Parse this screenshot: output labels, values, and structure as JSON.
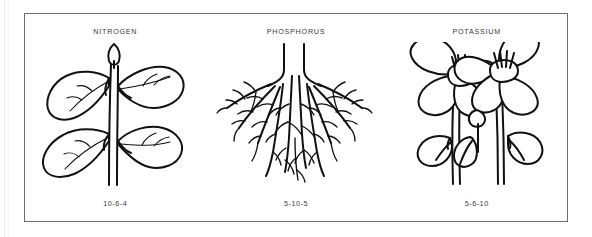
{
  "figure": {
    "frame": {
      "border_color": "#6e6e6e",
      "background": "#ffffff"
    },
    "panels": [
      {
        "id": "nitrogen",
        "title": "NITROGEN",
        "ratio": "10-6-4",
        "illustration": "leafy-plant-with-bud",
        "illustration_label": "Leafy plant with central stem, four broad leaves and an apical bud"
      },
      {
        "id": "phosphorus",
        "title": "PHOSPHORUS",
        "ratio": "5-10-5",
        "illustration": "branching-root-system",
        "illustration_label": "Branching fibrous root system descending from a cut stem"
      },
      {
        "id": "potassium",
        "title": "POTASSIUM",
        "ratio": "5-6-10",
        "illustration": "two-flowers-with-leaves",
        "illustration_label": "Two open pansy-like flowers with stamens, stems, buds and leaves"
      }
    ]
  },
  "style": {
    "ink_color": "#111111",
    "text_color": "#3b3b3b",
    "page_background": "#ffffff"
  }
}
